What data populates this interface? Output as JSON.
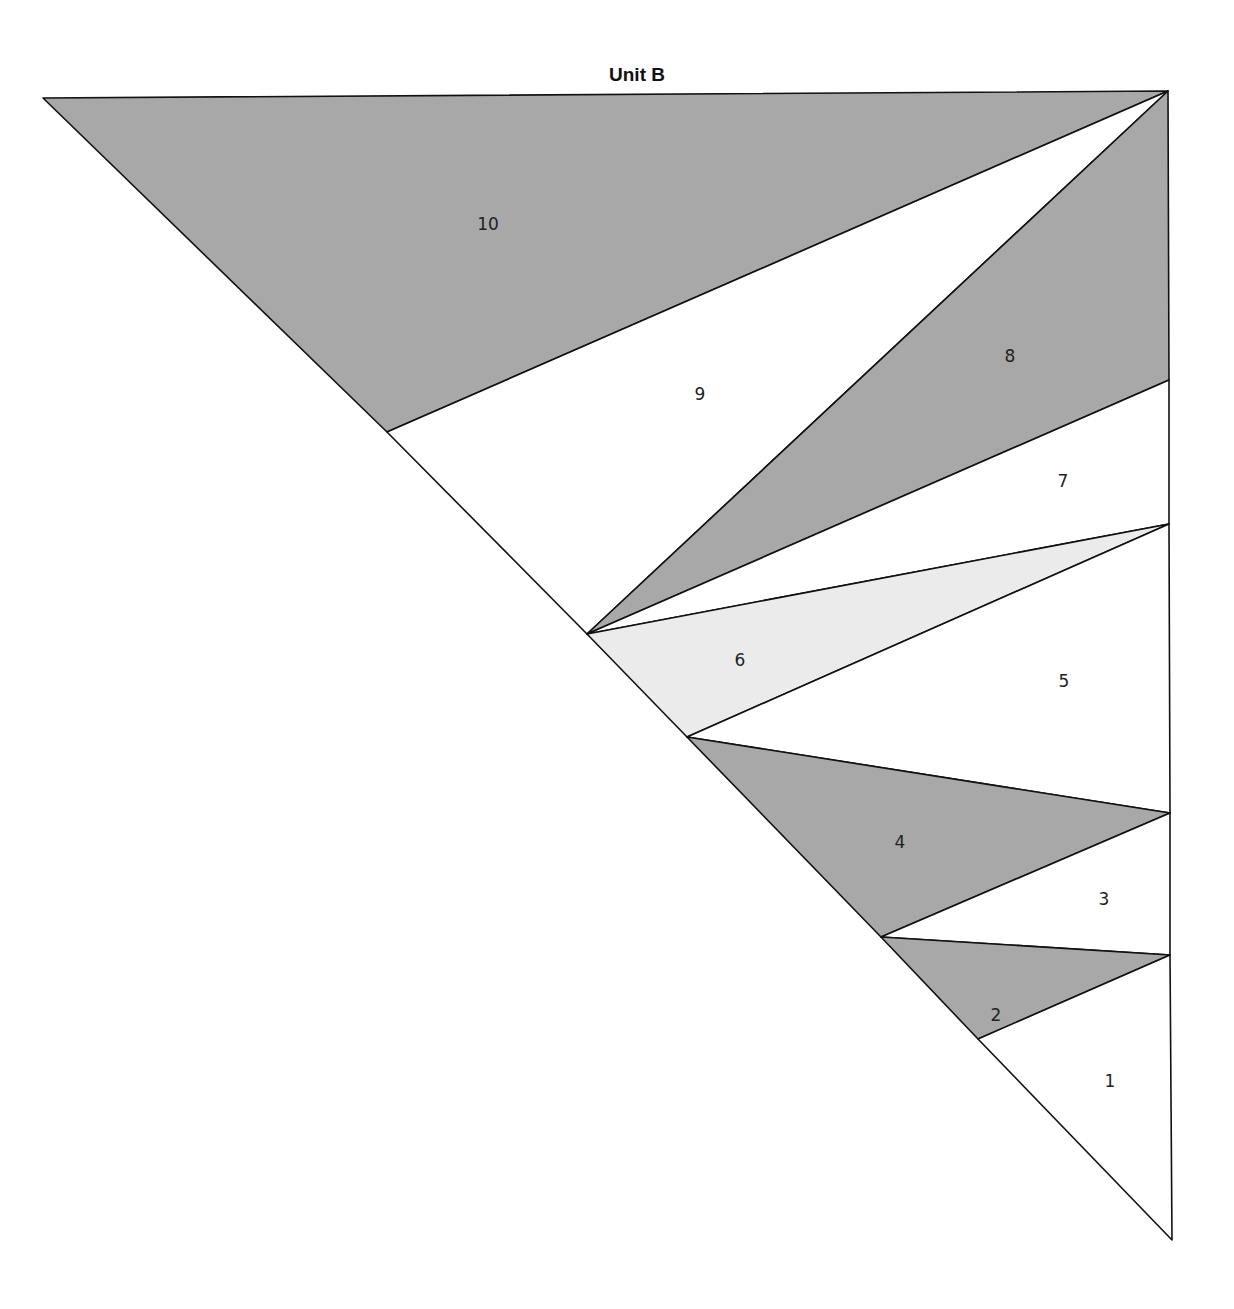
{
  "title": "Unit B",
  "colors": {
    "dark": "#a8a8a8",
    "light": "#ebebeb",
    "white": "#ffffff",
    "stroke": "#111111"
  },
  "pieces": [
    {
      "id": "10",
      "label": "10",
      "fill": "dark"
    },
    {
      "id": "9",
      "label": "9",
      "fill": "white"
    },
    {
      "id": "8",
      "label": "8",
      "fill": "dark"
    },
    {
      "id": "7",
      "label": "7",
      "fill": "white"
    },
    {
      "id": "6",
      "label": "6",
      "fill": "light"
    },
    {
      "id": "5",
      "label": "5",
      "fill": "white"
    },
    {
      "id": "4",
      "label": "4",
      "fill": "dark"
    },
    {
      "id": "3",
      "label": "3",
      "fill": "white"
    },
    {
      "id": "2",
      "label": "2",
      "fill": "dark"
    },
    {
      "id": "1",
      "label": "1",
      "fill": "white"
    }
  ]
}
